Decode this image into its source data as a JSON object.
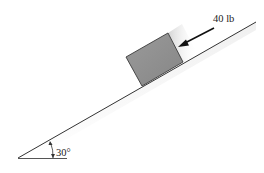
{
  "diagram": {
    "type": "inclined-plane-free-body",
    "force": {
      "label": "40 lb",
      "direction": "down-slope, parallel to incline"
    },
    "angle": {
      "label": "30°"
    },
    "colors": {
      "block_fill": "#8f8f8f",
      "block_stroke": "#3a3a3a",
      "line": "#333333",
      "shadow": "#d6d6d6"
    }
  }
}
